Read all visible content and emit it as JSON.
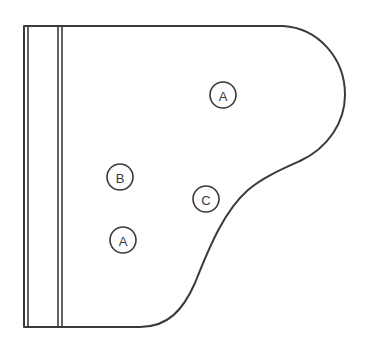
{
  "diagram": {
    "stroke_color": "#3a3a3a",
    "background": "#ffffff",
    "markers": [
      {
        "label": "A",
        "cx": 223,
        "cy": 95,
        "r": 13
      },
      {
        "label": "B",
        "cx": 120,
        "cy": 177,
        "r": 13
      },
      {
        "label": "C",
        "cx": 206,
        "cy": 199,
        "r": 13
      },
      {
        "label": "A",
        "cx": 123,
        "cy": 240,
        "r": 13
      }
    ]
  }
}
